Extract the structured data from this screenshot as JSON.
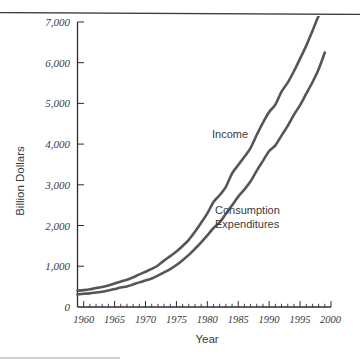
{
  "figure": {
    "name": "income-and-consumption-expenditures-line-chart",
    "axis_title_y": "Billion Dollars",
    "axis_title_x": "Year",
    "series_label_income": "Income",
    "series_label_consumption_line1": "Consumption",
    "series_label_consumption_line2": "Expenditures"
  },
  "colors": {
    "curve": "#55555a",
    "axis": "#2e2e30",
    "text": "#3a3a3c",
    "background": "#ffffff",
    "rule": "#3d3d40"
  },
  "chart_data": {
    "type": "line",
    "title": "",
    "xlabel": "Year",
    "ylabel": "Billion Dollars",
    "xlim": [
      1959,
      2000
    ],
    "ylim": [
      0,
      7000
    ],
    "grid": false,
    "legend": "inline-annotations",
    "ytick_labels": [
      "0",
      "1,000",
      "2,000",
      "3,000",
      "4,000",
      "5,000",
      "6,000",
      "7,000"
    ],
    "ytick_values": [
      0,
      1000,
      2000,
      3000,
      4000,
      5000,
      6000,
      7000
    ],
    "xtick_labels": [
      "1960",
      "1965",
      "1970",
      "1975",
      "1980",
      "1985",
      "1990",
      "1995",
      "2000"
    ],
    "xtick_values": [
      1960,
      1965,
      1970,
      1975,
      1980,
      1985,
      1990,
      1995,
      2000
    ],
    "x_minor_tick_interval": 1,
    "x": [
      1959,
      1960,
      1961,
      1962,
      1963,
      1964,
      1965,
      1966,
      1967,
      1968,
      1969,
      1970,
      1971,
      1972,
      1973,
      1974,
      1975,
      1976,
      1977,
      1978,
      1979,
      1980,
      1981,
      1982,
      1983,
      1984,
      1985,
      1986,
      1987,
      1988,
      1989,
      1990,
      1991,
      1992,
      1993,
      1994,
      1995,
      1996,
      1997,
      1998,
      1999
    ],
    "series": [
      {
        "name": "Income",
        "values": [
          400,
          415,
          435,
          465,
          490,
          530,
          575,
          625,
          670,
          730,
          800,
          865,
          935,
          1020,
          1140,
          1250,
          1365,
          1500,
          1650,
          1850,
          2070,
          2300,
          2580,
          2750,
          2950,
          3280,
          3490,
          3690,
          3910,
          4230,
          4530,
          4790,
          4970,
          5290,
          5510,
          5790,
          6100,
          6420,
          6780,
          7150,
          7400
        ]
      },
      {
        "name": "Consumption Expenditures",
        "values": [
          310,
          325,
          335,
          355,
          375,
          405,
          440,
          480,
          505,
          555,
          605,
          650,
          700,
          770,
          850,
          930,
          1030,
          1150,
          1280,
          1430,
          1590,
          1760,
          1940,
          2080,
          2290,
          2500,
          2710,
          2890,
          3090,
          3350,
          3590,
          3830,
          3970,
          4210,
          4450,
          4720,
          4960,
          5240,
          5520,
          5840,
          6250
        ]
      }
    ],
    "annotations": [
      {
        "text": "Income",
        "x": 1985,
        "y": 4300
      },
      {
        "text": "Consumption Expenditures",
        "x": 1986,
        "y": 2700
      }
    ]
  }
}
